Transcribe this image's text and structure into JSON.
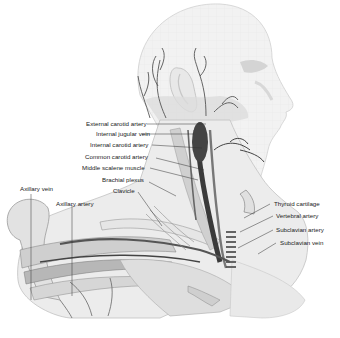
{
  "diagram": {
    "labels": {
      "external_carotid_artery": "External carotid artery",
      "internal_jugular_vein": "Internal jugular vein",
      "internal_carotid_artery": "Internal carotid artery",
      "common_carotid_artery": "Common carotid artery",
      "middle_scalene_muscle": "Middle scalene muscle",
      "brachial_plexus": "Brachial plexus",
      "clavicle": "Clavicle",
      "axillary_vein": "Axillary vein",
      "axillary_artery": "Axillary artery",
      "thyroid_cartilage": "Thyroid cartilage",
      "vertebral_artery": "Vertebral artery",
      "subclavian_artery": "Subclavian artery",
      "subclavian_vein": "Subclavian vein"
    },
    "colors": {
      "skin": "#efefef",
      "outline": "#c8c8c8",
      "vessel_dark": "#555555",
      "vein_dark": "#3a3a3a",
      "leader_line": "#333333"
    }
  }
}
